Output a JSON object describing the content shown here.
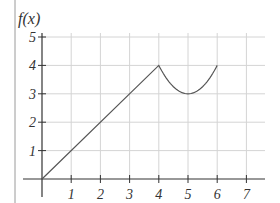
{
  "chart_data": {
    "type": "line",
    "title": "",
    "xlabel": "",
    "ylabel": "f(x)",
    "xlim": [
      0,
      7
    ],
    "ylim": [
      0,
      5
    ],
    "x_ticks": [
      "1",
      "2",
      "3",
      "4",
      "5",
      "6",
      "7"
    ],
    "y_ticks": [
      "1",
      "2",
      "3",
      "4",
      "5"
    ],
    "grid": true,
    "legend": null,
    "series": [
      {
        "name": "f(x)",
        "pieces": [
          {
            "domain": [
              0,
              4
            ],
            "formula": "x",
            "points": [
              [
                0,
                0
              ],
              [
                1,
                1
              ],
              [
                2,
                2
              ],
              [
                3,
                3
              ],
              [
                4,
                4
              ]
            ]
          },
          {
            "domain": [
              4,
              6
            ],
            "formula": "(x-5)^2+3",
            "points": [
              [
                4,
                4
              ],
              [
                4.5,
                3.25
              ],
              [
                5,
                3
              ],
              [
                5.5,
                3.25
              ],
              [
                6,
                4
              ]
            ]
          }
        ]
      }
    ],
    "colors": {
      "curve": "#555555",
      "axis": "#333333",
      "grid": "#d4d4d4",
      "border": "#999999"
    }
  }
}
